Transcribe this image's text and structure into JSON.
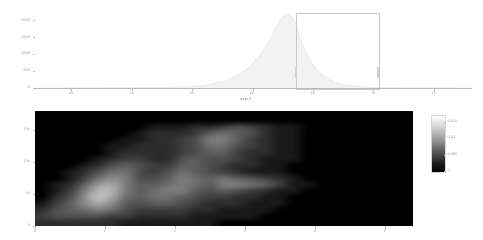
{
  "figure": {
    "background": "#ffffff",
    "axis_color": "#b9b9b9",
    "label_color": "#9a9a9a"
  },
  "chart_data": [
    {
      "type": "area",
      "name": "depth-histogram",
      "title": "",
      "xlabel": "depth",
      "ylabel": "",
      "xlim": [
        42.0,
        78.0
      ],
      "ylim": [
        0,
        2250
      ],
      "xticks": [
        45,
        50,
        55,
        60,
        65,
        70,
        75
      ],
      "xticklabels": [
        "45",
        "50",
        "55",
        "60",
        "65",
        "70",
        "75"
      ],
      "yticks": [
        0,
        500,
        1000,
        1500,
        2000
      ],
      "yticklabels": [
        "0",
        "500",
        "1000",
        "1500",
        "2000"
      ],
      "grid": false,
      "legend": null,
      "fill_color": "#f2f2f2",
      "line_color": "#e4e4e4",
      "x": [
        42,
        43,
        44,
        45,
        46,
        47,
        48,
        49,
        50,
        51,
        52,
        53,
        54,
        55,
        55.5,
        56,
        56.5,
        57,
        57.5,
        58,
        58.5,
        59,
        59.5,
        60,
        60.5,
        61,
        61.25,
        61.5,
        61.75,
        62,
        62.25,
        62.5,
        62.75,
        63,
        63.25,
        63.5,
        63.75,
        64,
        64.5,
        65,
        65.5,
        66,
        66.5,
        67,
        67.5,
        68,
        69,
        70,
        71,
        72,
        73,
        74,
        75,
        76,
        77,
        78
      ],
      "y": [
        0,
        0,
        0,
        2,
        3,
        4,
        5,
        7,
        9,
        12,
        16,
        22,
        30,
        45,
        60,
        85,
        115,
        150,
        195,
        250,
        330,
        430,
        560,
        720,
        930,
        1190,
        1330,
        1480,
        1650,
        1830,
        2010,
        2120,
        2180,
        2200,
        2120,
        1950,
        1700,
        1420,
        1000,
        700,
        480,
        330,
        230,
        160,
        110,
        75,
        40,
        22,
        12,
        7,
        4,
        2,
        1,
        1,
        0,
        0
      ],
      "annotations": [
        {
          "type": "rectangle",
          "label": "selection-box",
          "x0": 65.0,
          "x1": 71.8,
          "y0": 0,
          "y1": 2230,
          "stroke": "#c9c9c9",
          "fill": "none"
        }
      ]
    },
    {
      "type": "heatmap",
      "name": "density-heatmap",
      "title": "",
      "xlabel": "",
      "ylabel": "",
      "xlim": [
        0,
        5.4
      ],
      "ylim": [
        0,
        18000
      ],
      "xticks": [
        0,
        1,
        2,
        3,
        4,
        5
      ],
      "xticklabels": [
        "0",
        "1",
        "2",
        "3",
        "4",
        "5"
      ],
      "yticks": [
        0,
        5000,
        10000,
        15000
      ],
      "yticklabels": [
        "0",
        "5k",
        "10k",
        "15k"
      ],
      "colormap": "gray",
      "colorbar": {
        "ticks": [
          0,
          0.005,
          0.01,
          0.015
        ],
        "ticklabels": [
          "0",
          "0.005",
          "0.01",
          "0.015"
        ],
        "vmin": 0,
        "vmax": 0.017,
        "position": "right"
      },
      "nx": 27,
      "ny": 18,
      "values": [
        [
          0.0,
          0.0,
          0.0,
          0.0,
          0.0,
          0.0,
          0.0,
          0.0,
          0.0,
          0.0,
          0.0,
          0.0,
          0.0,
          0.0,
          0.0,
          0.0,
          0.0,
          0.0,
          0.0,
          0.0,
          0.0,
          0.0,
          0.0,
          0.0,
          0.0,
          0.0,
          0.0
        ],
        [
          0.0,
          0.0,
          0.0,
          0.0,
          0.0,
          0.0,
          0.0,
          0.0,
          0.0,
          0.0,
          0.0,
          0.0,
          0.0,
          0.0,
          0.0,
          0.0,
          0.0,
          0.0,
          0.0,
          0.0,
          0.0,
          0.0,
          0.0,
          0.0,
          0.0,
          0.0,
          0.0
        ],
        [
          0.0,
          0.0,
          0.0,
          0.0,
          0.0,
          0.0,
          0.0,
          0.0,
          0.001,
          0.001,
          0.001,
          0.002,
          0.002,
          0.003,
          0.004,
          0.003,
          0.002,
          0.001,
          0.001,
          0.0,
          0.0,
          0.0,
          0.0,
          0.0,
          0.0,
          0.0,
          0.0
        ],
        [
          0.0,
          0.0,
          0.0,
          0.0,
          0.0,
          0.0,
          0.0,
          0.001,
          0.002,
          0.002,
          0.002,
          0.003,
          0.005,
          0.006,
          0.005,
          0.004,
          0.002,
          0.001,
          0.001,
          0.0,
          0.0,
          0.0,
          0.0,
          0.0,
          0.0,
          0.0,
          0.0
        ],
        [
          0.0,
          0.0,
          0.0,
          0.0,
          0.0,
          0.0,
          0.001,
          0.001,
          0.002,
          0.002,
          0.003,
          0.004,
          0.007,
          0.007,
          0.005,
          0.003,
          0.002,
          0.001,
          0.001,
          0.0,
          0.0,
          0.0,
          0.0,
          0.0,
          0.0,
          0.0,
          0.0
        ],
        [
          0.0,
          0.0,
          0.0,
          0.0,
          0.0,
          0.001,
          0.001,
          0.002,
          0.002,
          0.002,
          0.003,
          0.004,
          0.006,
          0.006,
          0.004,
          0.003,
          0.002,
          0.001,
          0.001,
          0.0,
          0.0,
          0.0,
          0.0,
          0.0,
          0.0,
          0.0,
          0.0
        ],
        [
          0.0,
          0.0,
          0.0,
          0.0,
          0.0,
          0.001,
          0.002,
          0.002,
          0.002,
          0.002,
          0.003,
          0.004,
          0.005,
          0.005,
          0.003,
          0.002,
          0.002,
          0.001,
          0.001,
          0.0,
          0.0,
          0.0,
          0.0,
          0.0,
          0.0,
          0.0,
          0.0
        ],
        [
          0.0,
          0.0,
          0.0,
          0.0,
          0.001,
          0.002,
          0.003,
          0.003,
          0.002,
          0.002,
          0.004,
          0.005,
          0.004,
          0.004,
          0.003,
          0.002,
          0.001,
          0.001,
          0.001,
          0.0,
          0.0,
          0.0,
          0.0,
          0.0,
          0.0,
          0.0,
          0.0
        ],
        [
          0.0,
          0.0,
          0.0,
          0.001,
          0.002,
          0.004,
          0.005,
          0.004,
          0.003,
          0.003,
          0.005,
          0.005,
          0.004,
          0.003,
          0.002,
          0.002,
          0.001,
          0.001,
          0.0,
          0.0,
          0.0,
          0.0,
          0.0,
          0.0,
          0.0,
          0.0,
          0.0
        ],
        [
          0.0,
          0.0,
          0.001,
          0.002,
          0.004,
          0.006,
          0.006,
          0.004,
          0.003,
          0.004,
          0.006,
          0.005,
          0.004,
          0.003,
          0.002,
          0.001,
          0.001,
          0.001,
          0.0,
          0.0,
          0.0,
          0.0,
          0.0,
          0.0,
          0.0,
          0.0,
          0.0
        ],
        [
          0.0,
          0.0,
          0.001,
          0.003,
          0.006,
          0.008,
          0.007,
          0.004,
          0.004,
          0.005,
          0.007,
          0.006,
          0.005,
          0.006,
          0.005,
          0.004,
          0.003,
          0.002,
          0.001,
          0.0,
          0.0,
          0.0,
          0.0,
          0.0,
          0.0,
          0.0,
          0.0
        ],
        [
          0.0,
          0.001,
          0.002,
          0.005,
          0.009,
          0.01,
          0.007,
          0.005,
          0.005,
          0.006,
          0.007,
          0.006,
          0.005,
          0.007,
          0.007,
          0.006,
          0.005,
          0.003,
          0.001,
          0.001,
          0.0,
          0.0,
          0.0,
          0.0,
          0.0,
          0.0,
          0.0
        ],
        [
          0.0,
          0.001,
          0.003,
          0.007,
          0.011,
          0.011,
          0.007,
          0.005,
          0.006,
          0.007,
          0.007,
          0.005,
          0.004,
          0.005,
          0.004,
          0.003,
          0.002,
          0.001,
          0.001,
          0.0,
          0.0,
          0.0,
          0.0,
          0.0,
          0.0,
          0.0,
          0.0
        ],
        [
          0.0,
          0.002,
          0.004,
          0.008,
          0.012,
          0.01,
          0.006,
          0.005,
          0.006,
          0.006,
          0.005,
          0.004,
          0.003,
          0.003,
          0.002,
          0.002,
          0.001,
          0.001,
          0.0,
          0.0,
          0.0,
          0.0,
          0.0,
          0.0,
          0.0,
          0.0,
          0.0
        ],
        [
          0.001,
          0.003,
          0.005,
          0.008,
          0.01,
          0.008,
          0.005,
          0.004,
          0.005,
          0.005,
          0.004,
          0.003,
          0.002,
          0.002,
          0.002,
          0.001,
          0.001,
          0.001,
          0.0,
          0.0,
          0.0,
          0.0,
          0.0,
          0.0,
          0.0,
          0.0,
          0.0
        ],
        [
          0.002,
          0.004,
          0.005,
          0.006,
          0.007,
          0.006,
          0.004,
          0.003,
          0.003,
          0.003,
          0.003,
          0.002,
          0.002,
          0.001,
          0.001,
          0.001,
          0.001,
          0.0,
          0.0,
          0.0,
          0.0,
          0.0,
          0.0,
          0.0,
          0.0,
          0.0,
          0.0
        ],
        [
          0.003,
          0.004,
          0.004,
          0.004,
          0.004,
          0.003,
          0.003,
          0.002,
          0.002,
          0.002,
          0.002,
          0.001,
          0.001,
          0.001,
          0.001,
          0.001,
          0.0,
          0.0,
          0.0,
          0.0,
          0.0,
          0.0,
          0.0,
          0.0,
          0.0,
          0.0,
          0.0
        ],
        [
          0.002,
          0.002,
          0.002,
          0.002,
          0.002,
          0.002,
          0.001,
          0.001,
          0.001,
          0.001,
          0.001,
          0.001,
          0.001,
          0.0,
          0.0,
          0.0,
          0.0,
          0.0,
          0.0,
          0.0,
          0.0,
          0.0,
          0.0,
          0.0,
          0.0,
          0.0,
          0.0
        ]
      ]
    }
  ]
}
